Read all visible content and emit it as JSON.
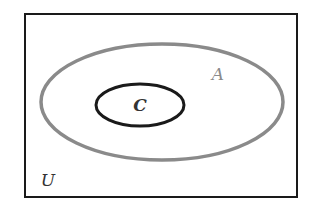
{
  "diagram": {
    "type": "venn",
    "universe": {
      "label": "U",
      "x": 25,
      "y": 14,
      "width": 272,
      "height": 183,
      "stroke": "#1a1a1a",
      "stroke_width": 2
    },
    "sets": [
      {
        "label": "A",
        "cx": 162,
        "cy": 102,
        "rx": 121,
        "ry": 58,
        "stroke": "#8a8a8a",
        "stroke_width": 3.5,
        "label_x": 218,
        "label_y": 80,
        "label_color": "#8a8a8a"
      },
      {
        "label": "C",
        "cx": 140,
        "cy": 105,
        "rx": 44,
        "ry": 21,
        "stroke": "#1a1a1a",
        "stroke_width": 3,
        "label_x": 140,
        "label_y": 111,
        "label_color": "#333333"
      }
    ],
    "universe_label": {
      "text": "U",
      "x": 48,
      "y": 186,
      "color": "#333333"
    },
    "relationship": "C ⊂ A ⊂ U"
  }
}
